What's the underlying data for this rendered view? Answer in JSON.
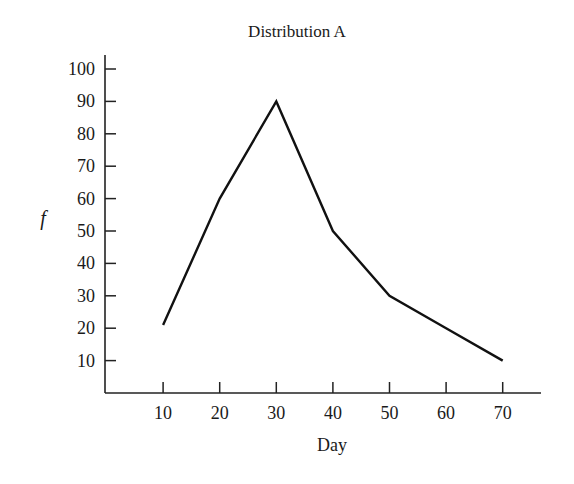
{
  "chart_data": {
    "type": "line",
    "title": "Distribution A",
    "xlabel": "Day",
    "ylabel": "f",
    "x": [
      10,
      20,
      30,
      40,
      50,
      60,
      70
    ],
    "categories": [
      "10",
      "20",
      "30",
      "40",
      "50",
      "60",
      "70"
    ],
    "series": [
      {
        "name": "Distribution A",
        "values": [
          21,
          60,
          90,
          50,
          30,
          20,
          10
        ]
      }
    ],
    "x_ticks": [
      "10",
      "20",
      "30",
      "40",
      "50",
      "60",
      "70"
    ],
    "y_ticks": [
      "10",
      "20",
      "30",
      "40",
      "50",
      "60",
      "70",
      "80",
      "90",
      "100"
    ],
    "xlim": [
      0,
      77
    ],
    "ylim": [
      0,
      105
    ],
    "grid": false,
    "legend": "none",
    "line_color": "#111111"
  }
}
